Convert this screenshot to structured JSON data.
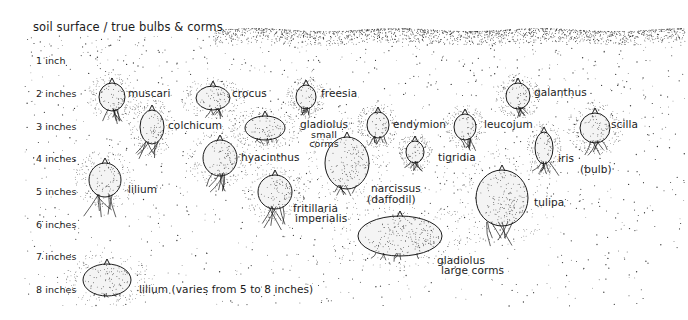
{
  "title": "soil surface / true bulbs & corms",
  "depth_scale": {
    "unit": "inches",
    "labels": [
      "1 inch",
      "2 inches",
      "3 inches",
      "4 inches",
      "5 inches",
      "6 inches",
      "7 inches",
      "8 inches"
    ]
  },
  "bulbs": [
    {
      "id": "muscari",
      "label": "muscari",
      "depth_in": 2
    },
    {
      "id": "crocus",
      "label": "crocus",
      "depth_in": 2
    },
    {
      "id": "freesia",
      "label": "freesia",
      "depth_in": 2
    },
    {
      "id": "galanthus",
      "label": "galanthus",
      "depth_in": 2
    },
    {
      "id": "colchicum",
      "label": "colchicum",
      "depth_in": 3
    },
    {
      "id": "gladiolus-small",
      "label": "gladiolus",
      "sublabel": "small corms",
      "depth_in": 3
    },
    {
      "id": "endymion",
      "label": "endymion",
      "depth_in": 3
    },
    {
      "id": "leucojum",
      "label": "leucojum",
      "depth_in": 3
    },
    {
      "id": "scilla",
      "label": "scilla",
      "depth_in": 3
    },
    {
      "id": "hyacinthus",
      "label": "hyacinthus",
      "depth_in": 4
    },
    {
      "id": "tigridia",
      "label": "tigridia",
      "depth_in": 4
    },
    {
      "id": "iris",
      "label": "iris",
      "sublabel": "(bulb)",
      "depth_in": 4
    },
    {
      "id": "lilium-5",
      "label": "lilium",
      "depth_in": 5
    },
    {
      "id": "narcissus",
      "label": "narcissus",
      "sublabel": "(daffodil)",
      "depth_in": 5
    },
    {
      "id": "fritillaria",
      "label": "fritillaria",
      "sublabel": "imperialis",
      "depth_in": 6
    },
    {
      "id": "tulipa",
      "label": "tulipa",
      "depth_in": 6
    },
    {
      "id": "gladiolus-large",
      "label": "gladiolus",
      "sublabel": "large corms",
      "depth_in": 7
    },
    {
      "id": "lilium-8",
      "label": "lilium (varies from 5 to 8 inches)",
      "depth_in": 8
    }
  ],
  "colors": {
    "ink": "#1b1b1b",
    "stipple": "#3a3a3a",
    "paper": "#ffffff"
  }
}
